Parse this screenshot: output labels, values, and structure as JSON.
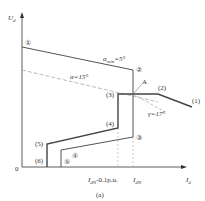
{
  "figure": {
    "caption": "(a)",
    "axes": {
      "y_label": "U",
      "y_label_sub": "d",
      "x_label": "I",
      "x_label_sub": "d",
      "origin": "0"
    },
    "x_ticks": [
      {
        "label_main": "I",
        "label_sub": "dN",
        "label_tail": "-0.1p.u."
      },
      {
        "label_main": "I",
        "label_sub": "dN",
        "label_tail": ""
      }
    ],
    "annotations": {
      "alpha_min_main": "α",
      "alpha_min_sub": "min",
      "alpha_min_tail": "=5°",
      "alpha": "α=15°",
      "gamma": "γ=17°",
      "point_a": "A"
    },
    "rectifier_markers": [
      "①",
      "②",
      "③",
      "④",
      "⑤"
    ],
    "inverter_markers": [
      "(1)",
      "(2)",
      "(3)",
      "(4)",
      "(5)",
      "(6)"
    ],
    "colors": {
      "line": "#444444",
      "dashed": "#aaaaaa",
      "axis": "#333333"
    }
  }
}
